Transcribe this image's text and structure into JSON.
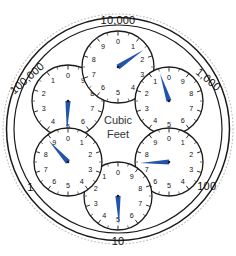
{
  "meter": {
    "title": "Cubic Feet",
    "center_label_line1": "Cubic",
    "center_label_line2": "Feet",
    "units": "Cubic Feet",
    "face_color": "#ffffff",
    "outline_color": "#1a1a1a",
    "needle_color": "#2255aa",
    "numeral_color": "#111111",
    "reading": "519755",
    "dial_count": 6
  },
  "chart_data": {
    "type": "gauge-dials",
    "title": "Cubic Feet",
    "units": "Cubic Feet",
    "dial_face_numerals": [
      "0",
      "1",
      "2",
      "3",
      "4",
      "5",
      "6",
      "7",
      "8",
      "9"
    ],
    "dials": [
      {
        "id": "dial-100000",
        "label": "100,000",
        "multiplier": 100000,
        "direction": "counterclockwise",
        "value": 5,
        "needle_angle_deg": 182,
        "label_rotation_deg": -42,
        "label_position": "outer",
        "cx": 68,
        "cy": 101,
        "r": 36
      },
      {
        "id": "dial-10000",
        "label": "10,000",
        "multiplier": 10000,
        "direction": "clockwise",
        "value": 1,
        "needle_angle_deg": 56,
        "label_rotation_deg": 0,
        "label_position": "outer",
        "cx": 118,
        "cy": 67,
        "r": 36
      },
      {
        "id": "dial-1000",
        "label": "1,000",
        "multiplier": 1000,
        "direction": "counterclockwise",
        "value": 9,
        "needle_angle_deg": -18,
        "label_rotation_deg": 40,
        "label_position": "outer",
        "cx": 169,
        "cy": 101,
        "r": 34
      },
      {
        "id": "dial-100",
        "label": "100",
        "multiplier": 100,
        "direction": "clockwise",
        "value": 7,
        "needle_angle_deg": 268,
        "label_rotation_deg": 0,
        "label_position": "outer",
        "cx": 169,
        "cy": 162,
        "r": 34
      },
      {
        "id": "dial-10",
        "label": "10",
        "multiplier": 10,
        "direction": "counterclockwise",
        "value": 5,
        "needle_angle_deg": 178,
        "label_rotation_deg": 0,
        "label_position": "outer",
        "cx": 118,
        "cy": 196,
        "r": 34
      },
      {
        "id": "dial-1",
        "label": "1",
        "multiplier": 1,
        "direction": "clockwise",
        "value": 8,
        "needle_angle_deg": 318,
        "label_rotation_deg": 0,
        "label_position": "outer",
        "cx": 68,
        "cy": 162,
        "r": 34
      }
    ]
  }
}
